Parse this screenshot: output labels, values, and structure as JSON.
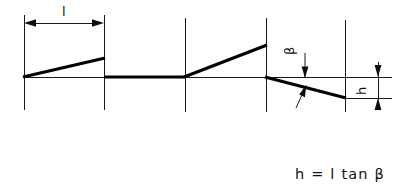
{
  "diagram": {
    "colors": {
      "stroke": "#1a1a1a",
      "thick_stroke": "#000000",
      "background": "#ffffff",
      "text": "#111111"
    },
    "labels": {
      "length_label": "l",
      "angle_label": "β",
      "height_label": "h"
    },
    "formula": {
      "text": "h = l tan β"
    },
    "dimensions": {
      "length_dimension": {
        "name": "l",
        "from_x": 24,
        "to_x": 104,
        "y": 23
      },
      "height_dimension": {
        "name": "h",
        "x": 378,
        "from_y": 62,
        "to_y": 100
      },
      "angle_dimension": {
        "name": "β",
        "x": 305,
        "from_y": 55,
        "to_y": 104
      }
    },
    "geometry": {
      "baseline_y": 77,
      "baseline_from_x": 24,
      "baseline_to_x": 392,
      "offset_line_y": 98,
      "offset_from_x": 345,
      "offset_to_x": 392,
      "verticals": [
        {
          "x": 24,
          "y1": 15,
          "y2": 110
        },
        {
          "x": 104,
          "y1": 15,
          "y2": 110
        },
        {
          "x": 185,
          "y1": 18,
          "y2": 112
        },
        {
          "x": 266,
          "y1": 18,
          "y2": 112
        },
        {
          "x": 345,
          "y1": 20,
          "y2": 112
        }
      ],
      "profile_segments": [
        {
          "name": "rising-flank-1",
          "x1": 24,
          "y1": 77,
          "x2": 104,
          "y2": 58
        },
        {
          "name": "flat-crest",
          "x1": 104,
          "y1": 77,
          "x2": 185,
          "y2": 77
        },
        {
          "name": "rising-flank-2",
          "x1": 185,
          "y1": 77,
          "x2": 266,
          "y2": 45
        },
        {
          "name": "falling-flank",
          "x1": 266,
          "y1": 77,
          "x2": 345,
          "y2": 98
        }
      ]
    }
  }
}
